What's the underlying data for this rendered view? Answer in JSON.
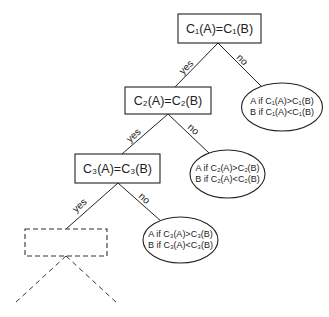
{
  "diagram": {
    "type": "decision-tree",
    "nodes": [
      {
        "id": "n1",
        "kind": "condition",
        "label": "C₁(A)=C₁(B)"
      },
      {
        "id": "n2",
        "kind": "condition",
        "label": "C₂(A)=C₂(B)"
      },
      {
        "id": "n3",
        "kind": "condition",
        "label": "C₃(A)=C₃(B)"
      },
      {
        "id": "n4",
        "kind": "placeholder",
        "label": ""
      }
    ],
    "outcomes": [
      {
        "id": "o1",
        "line1": "A if C₁(A)>C₁(B)",
        "line2": "B if C₁(A)<C₁(B)"
      },
      {
        "id": "o2",
        "line1": "A if C₂(A)>C₂(B)",
        "line2": "B if C₂(A)<C₂(B)"
      },
      {
        "id": "o3",
        "line1": "A if C₃(A)>C₃(B)",
        "line2": "B if C₃(A)<C₃(B)"
      }
    ],
    "edges": [
      {
        "from": "n1",
        "to": "n2",
        "label": "yes"
      },
      {
        "from": "n1",
        "to": "o1",
        "label": "no"
      },
      {
        "from": "n2",
        "to": "n3",
        "label": "yes"
      },
      {
        "from": "n2",
        "to": "o2",
        "label": "no"
      },
      {
        "from": "n3",
        "to": "n4",
        "label": "yes"
      },
      {
        "from": "n3",
        "to": "o3",
        "label": "no"
      }
    ]
  }
}
